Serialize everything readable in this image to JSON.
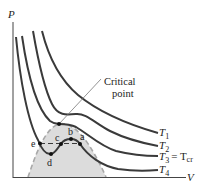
{
  "diagram": {
    "axes": {
      "y_label": "P",
      "x_label": "V"
    },
    "annotation": {
      "line1": "Critical",
      "line2": "point"
    },
    "isotherms": [
      {
        "name": "T1",
        "main": "T",
        "sub": "1"
      },
      {
        "name": "T2",
        "main": "T",
        "sub": "2"
      },
      {
        "name": "T3",
        "main": "T",
        "sub": "3",
        "equals": "= T",
        "equals_sub": "cr"
      },
      {
        "name": "T4",
        "main": "T",
        "sub": "4"
      }
    ],
    "points": {
      "a": "a",
      "b": "b",
      "c": "c",
      "d": "d",
      "e": "e"
    },
    "colors": {
      "curve": "#3a3a3a",
      "dome_fill": "#d9d9d9",
      "dome_edge": "#a8a8a8",
      "axis": "#444444"
    }
  }
}
